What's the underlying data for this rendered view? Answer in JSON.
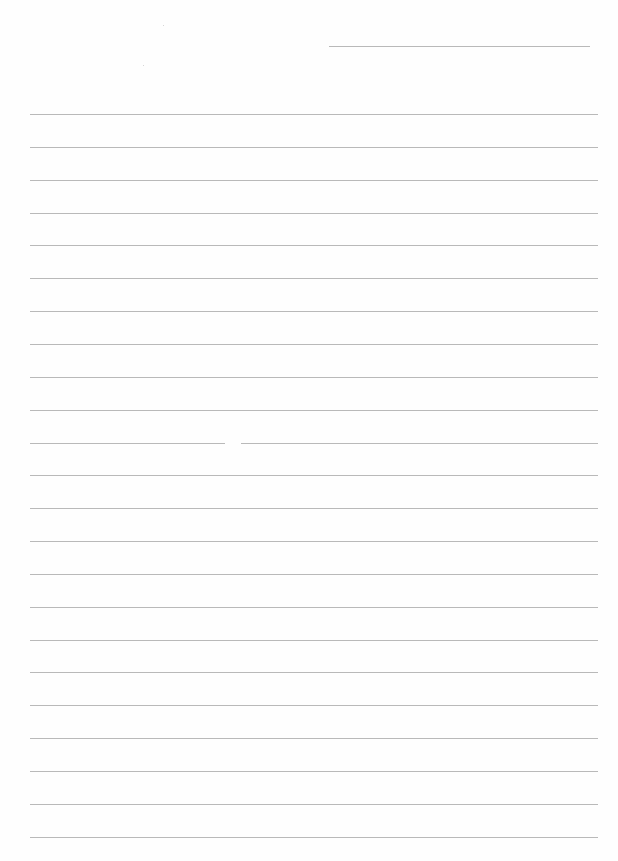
{
  "page": {
    "type": "lined-paper",
    "background": "#fefefe",
    "line_color": "#b9b9b9"
  },
  "header_line": {
    "x1": 329,
    "x2": 590,
    "y": 46
  },
  "ruled_lines": {
    "x1": 30,
    "x2": 598,
    "start_y": 114,
    "spacing": 32.85,
    "count": 23,
    "gaps": [
      {
        "line_index": 10,
        "gap_from_x": 225,
        "gap_to_x": 241
      }
    ]
  }
}
